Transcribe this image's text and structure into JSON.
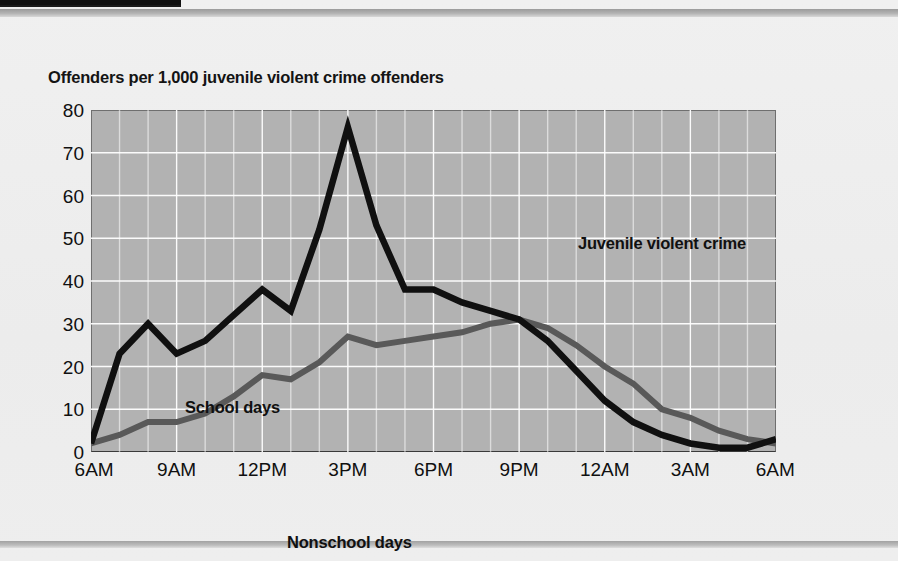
{
  "page": {
    "accent_black": "#111111",
    "rule_gray": "#b0b0b0",
    "paper": "#eeeeee"
  },
  "chart_data": {
    "type": "line",
    "title": "Offenders per 1,000 juvenile violent crime offenders",
    "xlabel": "",
    "ylabel": "Offenders per 1,000 juvenile violent crime offenders",
    "ylim": [
      0,
      80
    ],
    "yticks": [
      0,
      10,
      20,
      30,
      40,
      50,
      60,
      70,
      80
    ],
    "xticks": [
      "6AM",
      "9AM",
      "12PM",
      "3PM",
      "6PM",
      "9PM",
      "12AM",
      "3AM",
      "6AM"
    ],
    "xtick_hours": [
      0,
      3,
      6,
      9,
      12,
      15,
      18,
      21,
      24
    ],
    "xlim_hours": [
      0,
      24
    ],
    "grid": true,
    "grid_color": "#ffffff",
    "grid_vertical_step_hours": 1,
    "plot_background": "#b2b2b2",
    "legend_position": "inline-annotations",
    "annotations": [
      {
        "name": "chart-annotation-title",
        "text": "Juvenile violent crime"
      },
      {
        "name": "series-label-school",
        "text": "School days"
      },
      {
        "name": "series-label-nonschool",
        "text": "Nonschool days"
      }
    ],
    "x": [
      0,
      1,
      2,
      3,
      4,
      5,
      6,
      7,
      8,
      9,
      10,
      11,
      12,
      13,
      14,
      15,
      16,
      17,
      18,
      19,
      20,
      21,
      22,
      23,
      24
    ],
    "x_labels_hourly": [
      "6AM",
      "7AM",
      "8AM",
      "9AM",
      "10AM",
      "11AM",
      "12PM",
      "1PM",
      "2PM",
      "3PM",
      "4PM",
      "5PM",
      "6PM",
      "7PM",
      "8PM",
      "9PM",
      "10PM",
      "11PM",
      "12AM",
      "1AM",
      "2AM",
      "3AM",
      "4AM",
      "5AM",
      "6AM"
    ],
    "series": [
      {
        "name": "School days",
        "color": "#101010",
        "values": [
          2,
          23,
          30,
          23,
          26,
          32,
          38,
          33,
          52,
          76,
          53,
          38,
          38,
          35,
          33,
          31,
          26,
          19,
          12,
          7,
          4,
          2,
          1,
          1,
          3
        ]
      },
      {
        "name": "Nonschool days",
        "color": "#595959",
        "values": [
          2,
          4,
          7,
          7,
          9,
          13,
          18,
          17,
          21,
          27,
          25,
          26,
          27,
          28,
          30,
          31,
          29,
          25,
          20,
          16,
          10,
          8,
          5,
          3,
          2
        ]
      }
    ]
  }
}
